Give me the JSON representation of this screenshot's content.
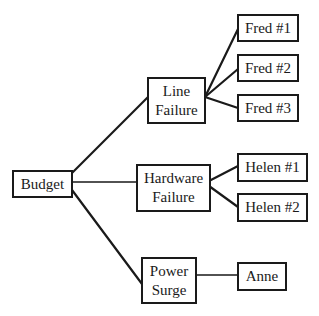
{
  "diagram": {
    "type": "tree",
    "root": {
      "id": "budget",
      "label": "Budget",
      "children": [
        {
          "id": "line-failure",
          "label": [
            "Line",
            "Failure"
          ],
          "children": [
            {
              "id": "fred-1",
              "label": "Fred #1"
            },
            {
              "id": "fred-2",
              "label": "Fred #2"
            },
            {
              "id": "fred-3",
              "label": "Fred #3"
            }
          ]
        },
        {
          "id": "hardware-failure",
          "label": [
            "Hardware",
            "Failure"
          ],
          "children": [
            {
              "id": "helen-1",
              "label": "Helen #1"
            },
            {
              "id": "helen-2",
              "label": "Helen #2"
            }
          ]
        },
        {
          "id": "power-surge",
          "label": [
            "Power",
            "Surge"
          ],
          "children": [
            {
              "id": "anne",
              "label": "Anne"
            }
          ]
        }
      ]
    }
  },
  "nodes": {
    "budget": {
      "line1": "Budget"
    },
    "line_failure": {
      "line1": "Line",
      "line2": "Failure"
    },
    "hardware_failure": {
      "line1": "Hardware",
      "line2": "Failure"
    },
    "power_surge": {
      "line1": "Power",
      "line2": "Surge"
    },
    "fred_1": {
      "line1": "Fred #1"
    },
    "fred_2": {
      "line1": "Fred #2"
    },
    "fred_3": {
      "line1": "Fred #3"
    },
    "helen_1": {
      "line1": "Helen #1"
    },
    "helen_2": {
      "line1": "Helen #2"
    },
    "anne": {
      "line1": "Anne"
    }
  },
  "colors": {
    "stroke": "#1a1a1a",
    "background": "#ffffff"
  }
}
